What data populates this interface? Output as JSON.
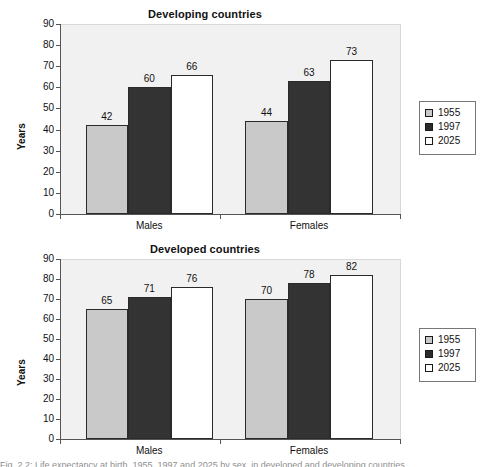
{
  "figure": {
    "caption_fragment": "Fig. 2.2: Life expectancy at birth, 1955, 1997 and 2025 by sex, in developed and developing countries"
  },
  "legend_series": [
    {
      "key": "s1955",
      "label": "1955",
      "color": "#c9c9c9"
    },
    {
      "key": "s1997",
      "label": "1997",
      "color": "#2b2b2b"
    },
    {
      "key": "s2025",
      "label": "2025",
      "color": "#ffffff"
    }
  ],
  "axis": {
    "ylabel": "Years",
    "yticks": [
      "90",
      "80",
      "70",
      "60",
      "50",
      "40",
      "30",
      "20",
      "10",
      "0"
    ],
    "categories": [
      "Males",
      "Females"
    ]
  },
  "charts": [
    {
      "id": "developing",
      "title": "Developing countries",
      "values": {
        "males": {
          "s1955": "42",
          "s1997": "60",
          "s2025": "66"
        },
        "females": {
          "s1955": "44",
          "s1997": "63",
          "s2025": "73"
        }
      }
    },
    {
      "id": "developed",
      "title": "Developed countries",
      "values": {
        "males": {
          "s1955": "65",
          "s1997": "71",
          "s2025": "76"
        },
        "females": {
          "s1955": "70",
          "s1997": "78",
          "s2025": "82"
        }
      }
    }
  ],
  "chart_data": [
    {
      "type": "bar",
      "title": "Developing countries",
      "xlabel": "",
      "ylabel": "Years",
      "categories": [
        "Males",
        "Females"
      ],
      "series": [
        {
          "name": "1955",
          "values": [
            42,
            44
          ]
        },
        {
          "name": "1997",
          "values": [
            60,
            63
          ]
        },
        {
          "name": "2025",
          "values": [
            66,
            73
          ]
        }
      ],
      "ylim": [
        0,
        90
      ],
      "ytick_step": 10,
      "grid": false,
      "legend_position": "right",
      "data_labels": true
    },
    {
      "type": "bar",
      "title": "Developed countries",
      "xlabel": "",
      "ylabel": "Years",
      "categories": [
        "Males",
        "Females"
      ],
      "series": [
        {
          "name": "1955",
          "values": [
            65,
            70
          ]
        },
        {
          "name": "1997",
          "values": [
            71,
            78
          ]
        },
        {
          "name": "2025",
          "values": [
            76,
            82
          ]
        }
      ],
      "ylim": [
        0,
        90
      ],
      "ytick_step": 10,
      "grid": false,
      "legend_position": "right",
      "data_labels": true
    }
  ]
}
